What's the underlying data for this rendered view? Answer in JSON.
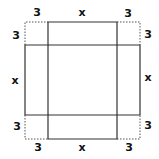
{
  "diagram": {
    "colors": {
      "line": "#333333",
      "dotted": "#555555",
      "text": "#111111",
      "background": "#ffffff"
    },
    "labels": {
      "top_left_h": "3",
      "top_mid": "x",
      "top_right_h": "3",
      "top_left_v": "3",
      "top_right_v": "3",
      "left_mid": "x",
      "right_mid": "x",
      "bottom_left_v": "3",
      "bottom_right_v": "3",
      "bottom_left_h": "3",
      "bottom_mid": "x",
      "bottom_right_h": "3"
    }
  }
}
